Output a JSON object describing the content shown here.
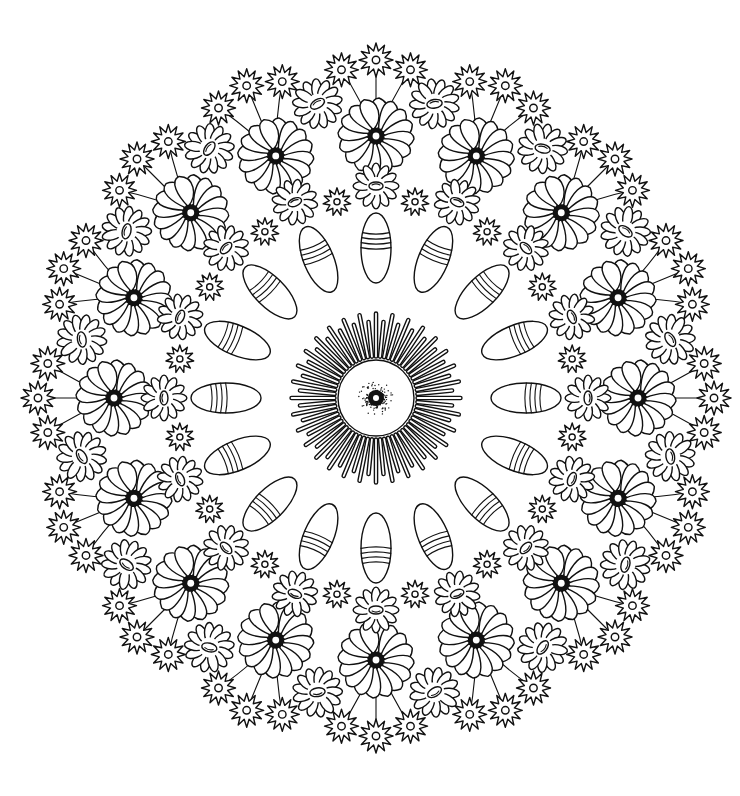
{
  "image": {
    "type": "coloring-page",
    "subject": "floral mandala",
    "colors": {
      "background": "#ffffff",
      "ink": "#111111"
    }
  },
  "mandala": {
    "center": [
      376,
      398
    ],
    "rings": [
      {
        "name": "center-hub",
        "radius": 38,
        "dotted_center": true
      },
      {
        "name": "sunburst-rays",
        "count": 64,
        "inner_radius": 40,
        "outer_radius": 86
      },
      {
        "name": "striped-petals",
        "count": 16,
        "radius": 150,
        "length": 70,
        "width": 30,
        "stripes": 4
      },
      {
        "name": "small-daisies-inner",
        "count": 16,
        "radius": 212,
        "size": 22
      },
      {
        "name": "small-star-flowers-inner",
        "count": 16,
        "radius": 200,
        "size": 14,
        "offset_deg": 11.25
      },
      {
        "name": "swirl-flowers",
        "count": 16,
        "radius": 262,
        "size": 38
      },
      {
        "name": "daisies-outer",
        "count": 16,
        "radius": 300,
        "size": 24,
        "offset_deg": 11.25
      },
      {
        "name": "star-flower-bouquets",
        "count": 16,
        "radius": 330,
        "flowers_per_bouquet": 3,
        "size": 17,
        "offset_deg": 0
      }
    ]
  }
}
